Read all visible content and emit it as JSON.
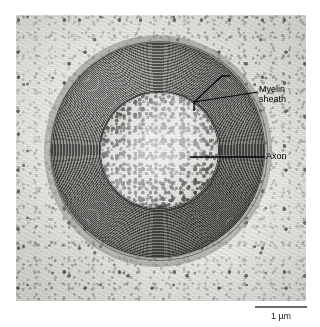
{
  "figure": {
    "type": "transmission-electron-micrograph",
    "width_px": 320,
    "height_px": 327,
    "background_color": "#ffffff"
  },
  "micrograph": {
    "plate_left_px": 16,
    "plate_top_px": 15,
    "plate_width_px": 290,
    "plate_height_px": 286,
    "tone": "grayscale",
    "matrix_color": "#dcdcd8",
    "myelin_dark_color": "#4f4f4d",
    "myelin_light_color": "#8e8e8c",
    "axoplasm_color": "#dcdcd9"
  },
  "annotations": {
    "myelin": {
      "line1": "Myelin",
      "line2": "sheath",
      "leader_color": "#000000",
      "pointer_shape": "bracket"
    },
    "axon": {
      "label": "Axon",
      "leader_color": "#000000",
      "pointer_shape": "line"
    }
  },
  "scale": {
    "bar_label": "1 µm",
    "bar_length_px": 52,
    "bar_color": "#6a6a68"
  }
}
